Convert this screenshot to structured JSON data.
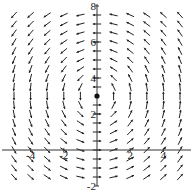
{
  "chart_data": {
    "type": "direction_field",
    "title": "",
    "xlabel": "",
    "ylabel": "",
    "xlim": [
      -5.6,
      5.6
    ],
    "ylim": [
      -2,
      8
    ],
    "x_ticks": [
      -4,
      -2,
      2,
      4
    ],
    "y_ticks": [
      -2,
      2,
      4,
      6,
      8
    ],
    "x_tick_labels": [
      "-4",
      "-2",
      "2",
      "4"
    ],
    "y_tick_labels": [
      "-2",
      "2",
      "4",
      "6",
      "8"
    ],
    "equilibrium_point": {
      "x": 0,
      "y": 3
    },
    "field": "circulation around (0,3): dx/dt = -(y-3), dy/dt = x",
    "grid": false,
    "arrow_color": "#222222",
    "axis_color": "#333333"
  }
}
